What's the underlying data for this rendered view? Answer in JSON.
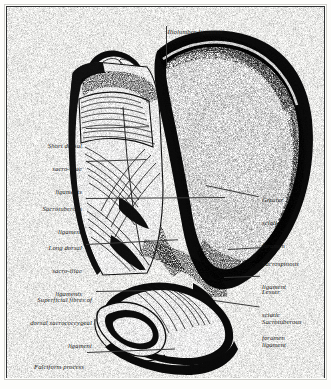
{
  "plate": {
    "title": "Iliolumbar ligament",
    "subject": "Posterior view of the right half of the pelvis showing the sacro-iliac and sacrotuberous ligaments",
    "style": "black-and-white anatomical engraving",
    "frame_color": "#2f3132",
    "background_color": "#fdfdfb",
    "ink_color": "#111111"
  },
  "labels": [
    {
      "id": "iliolumbar-ligament",
      "text": "Iliolumbar ligament",
      "lines": [
        "Iliolumbar ligament"
      ],
      "side": "top",
      "align": "center",
      "x": 156,
      "y": 14,
      "width": 78
    },
    {
      "id": "short-dorsal-sacro-iliac-ligaments",
      "text": "Short dorsal sacro-iliac ligaments",
      "lines": [
        "Short dorsal",
        "sacro-iliac",
        "ligaments"
      ],
      "side": "left",
      "align": "right",
      "x": 14,
      "y": 130,
      "width": 68
    },
    {
      "id": "sacrotuberous-ligament-left",
      "text": "Sacrotuberous ligament",
      "lines": [
        "Sacrotuberous",
        "ligament"
      ],
      "side": "left",
      "align": "right",
      "x": 14,
      "y": 186,
      "width": 68
    },
    {
      "id": "long-dorsal-sacro-iliac-ligaments",
      "text": "Long dorsal sacro-iliac ligaments",
      "lines": [
        "Long dorsal",
        "sacro-iliac",
        "ligaments"
      ],
      "side": "left",
      "align": "right",
      "x": 14,
      "y": 228,
      "width": 68
    },
    {
      "id": "superficial-fibres-of-dorsal-sacrococcygeal-ligament",
      "text": "Superficial fibres of dorsal sacrococcygeal ligament",
      "lines": [
        "Superficial fibres of",
        "dorsal sacrococcygeal",
        "ligament"
      ],
      "side": "left",
      "align": "right",
      "x": 10,
      "y": 278,
      "width": 82
    },
    {
      "id": "falciform-process",
      "text": "Falciform process",
      "lines": [
        "Falciform process"
      ],
      "side": "left",
      "align": "right",
      "x": 14,
      "y": 348,
      "width": 70
    },
    {
      "id": "greater-sciatic-foramen",
      "text": "Greater sciatic foramen",
      "lines": [
        "Greater",
        "sciatic",
        "foramen"
      ],
      "side": "right",
      "align": "left",
      "x": 262,
      "y": 182,
      "width": 60
    },
    {
      "id": "sacrospinous-ligament",
      "text": "Sacrospinous ligament",
      "lines": [
        "Sacrospinous",
        "ligament"
      ],
      "side": "right",
      "align": "left",
      "x": 262,
      "y": 245,
      "width": 60
    },
    {
      "id": "lesser-sciatic-foramen",
      "text": "Lesser sciatic foramen",
      "lines": [
        "Lesser",
        "sciatic",
        "foramen"
      ],
      "side": "right",
      "align": "left",
      "x": 262,
      "y": 272,
      "width": 60
    },
    {
      "id": "sacrotuberous-ligament-right",
      "text": "Sacrotuberous ligament",
      "lines": [
        "Sacrotuberous",
        "ligament"
      ],
      "side": "right",
      "align": "left",
      "x": 262,
      "y": 306,
      "width": 60
    }
  ],
  "label_text": {
    "iliolumbar_l1": "Iliolumbar ligament",
    "short_dorsal_l1": "Short dorsal",
    "short_dorsal_l2": "sacro-iliac",
    "short_dorsal_l3": "ligaments",
    "sacrotub_left_l1": "Sacrotuberous",
    "sacrotub_left_l2": "ligament",
    "long_dorsal_l1": "Long dorsal",
    "long_dorsal_l2": "sacro-iliac",
    "long_dorsal_l3": "ligaments",
    "superficial_l1": "Superficial fibres of",
    "superficial_l2": "dorsal sacrococcygeal",
    "superficial_l3": "ligament",
    "falciform_l1": "Falciform process",
    "greater_l1": "Greater",
    "greater_l2": "sciatic",
    "greater_l3": "foramen",
    "sacrospinous_l1": "Sacrospinous",
    "sacrospinous_l2": "ligament",
    "lesser_l1": "Lesser",
    "lesser_l2": "sciatic",
    "lesser_l3": "foramen",
    "sacrotub_right_l1": "Sacrotuberous",
    "sacrotub_right_l2": "ligament"
  }
}
